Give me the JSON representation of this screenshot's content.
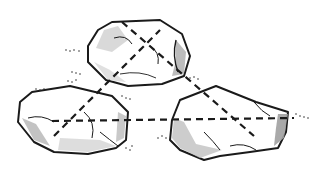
{
  "illustration": {
    "subject": "Three rocks connected by dashed lines",
    "style": "pen-and-ink sketch with grey shading",
    "colors": {
      "ink": "#1a1a1a",
      "shade": "#b5b5b5",
      "light_shade": "#dcdcdc",
      "background": "#ffffff"
    },
    "rocks": [
      {
        "name": "top-rock",
        "position": "top-center"
      },
      {
        "name": "left-rock",
        "position": "bottom-left"
      },
      {
        "name": "right-rock",
        "position": "bottom-right"
      }
    ],
    "connections": [
      {
        "from": "left-rock",
        "to": "right-rock",
        "style": "dashed"
      },
      {
        "from": "left-rock",
        "to": "top-rock",
        "style": "dashed"
      },
      {
        "from": "top-rock",
        "to": "right-rock",
        "style": "dashed"
      }
    ]
  }
}
